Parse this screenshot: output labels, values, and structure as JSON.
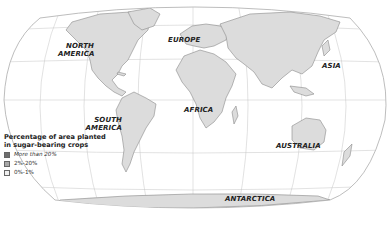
{
  "map": {
    "projection": "world map, elliptical graticule",
    "land_color": "#dcdcdc",
    "border_color": "#8a8a8a",
    "ocean_color": "#ffffff",
    "graticule_color": "#b8b8b8",
    "labels": {
      "north_america": [
        "NORTH",
        "AMERICA"
      ],
      "europe": "EUROPE",
      "asia": "ASIA",
      "south_america": [
        "SOUTH",
        "AMERICA"
      ],
      "africa": "AFRICA",
      "australia": "AUSTRALIA",
      "antarctica": "ANTARCTICA"
    }
  },
  "legend": {
    "title_line1": "Percentage of area planted",
    "title_line2": "in sugar-bearing crops",
    "items": [
      {
        "label": "More than 20%",
        "color": "#6e6e6e"
      },
      {
        "label": "2%-20%",
        "color": "#a8a8a8"
      },
      {
        "label": "0%-1%",
        "color": "#efefef"
      }
    ]
  }
}
